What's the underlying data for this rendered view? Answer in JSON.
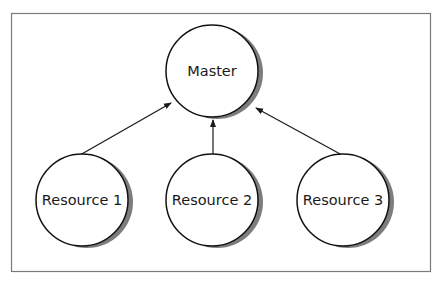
{
  "diagram": {
    "frame": {
      "x": 11,
      "y": 13,
      "width": 419,
      "height": 258,
      "stroke": "#7a7a7a"
    },
    "style": {
      "node_stroke": "#111111",
      "node_fill": "#ffffff",
      "shadow_color": "#777777",
      "edge_color": "#1a1a1a"
    },
    "nodes": [
      {
        "id": "master",
        "label": "Master",
        "cx": 212,
        "cy": 71,
        "r": 46
      },
      {
        "id": "resource1",
        "label": "Resource 1",
        "cx": 82,
        "cy": 200,
        "r": 46
      },
      {
        "id": "resource2",
        "label": "Resource 2",
        "cx": 212,
        "cy": 200,
        "r": 46
      },
      {
        "id": "resource3",
        "label": "Resource 3",
        "cx": 343,
        "cy": 200,
        "r": 46
      }
    ],
    "edges": [
      {
        "from": "resource1",
        "to": "master"
      },
      {
        "from": "resource2",
        "to": "master"
      },
      {
        "from": "resource3",
        "to": "master"
      }
    ]
  }
}
